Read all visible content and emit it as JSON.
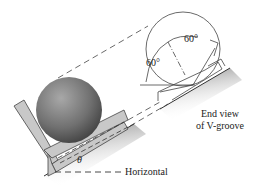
{
  "diagram": {
    "type": "mechanics-figure",
    "labels": {
      "angle_upper": "60°",
      "angle_left": "60°",
      "end_view_line1": "End view",
      "end_view_line2": "of V-groove",
      "theta": "θ",
      "horizontal": "Horizontal"
    },
    "elements": [
      "sphere resting in V-groove bracket",
      "inclined surface at angle θ",
      "horizontal reference dashed line",
      "end view circle with two 60° groove faces",
      "dashed projection lines"
    ],
    "colors": {
      "sphere": "#6e6e6e",
      "bracket": "#c8c8c8",
      "ground_shadow": "#9a9a9a",
      "line": "#333333"
    }
  }
}
